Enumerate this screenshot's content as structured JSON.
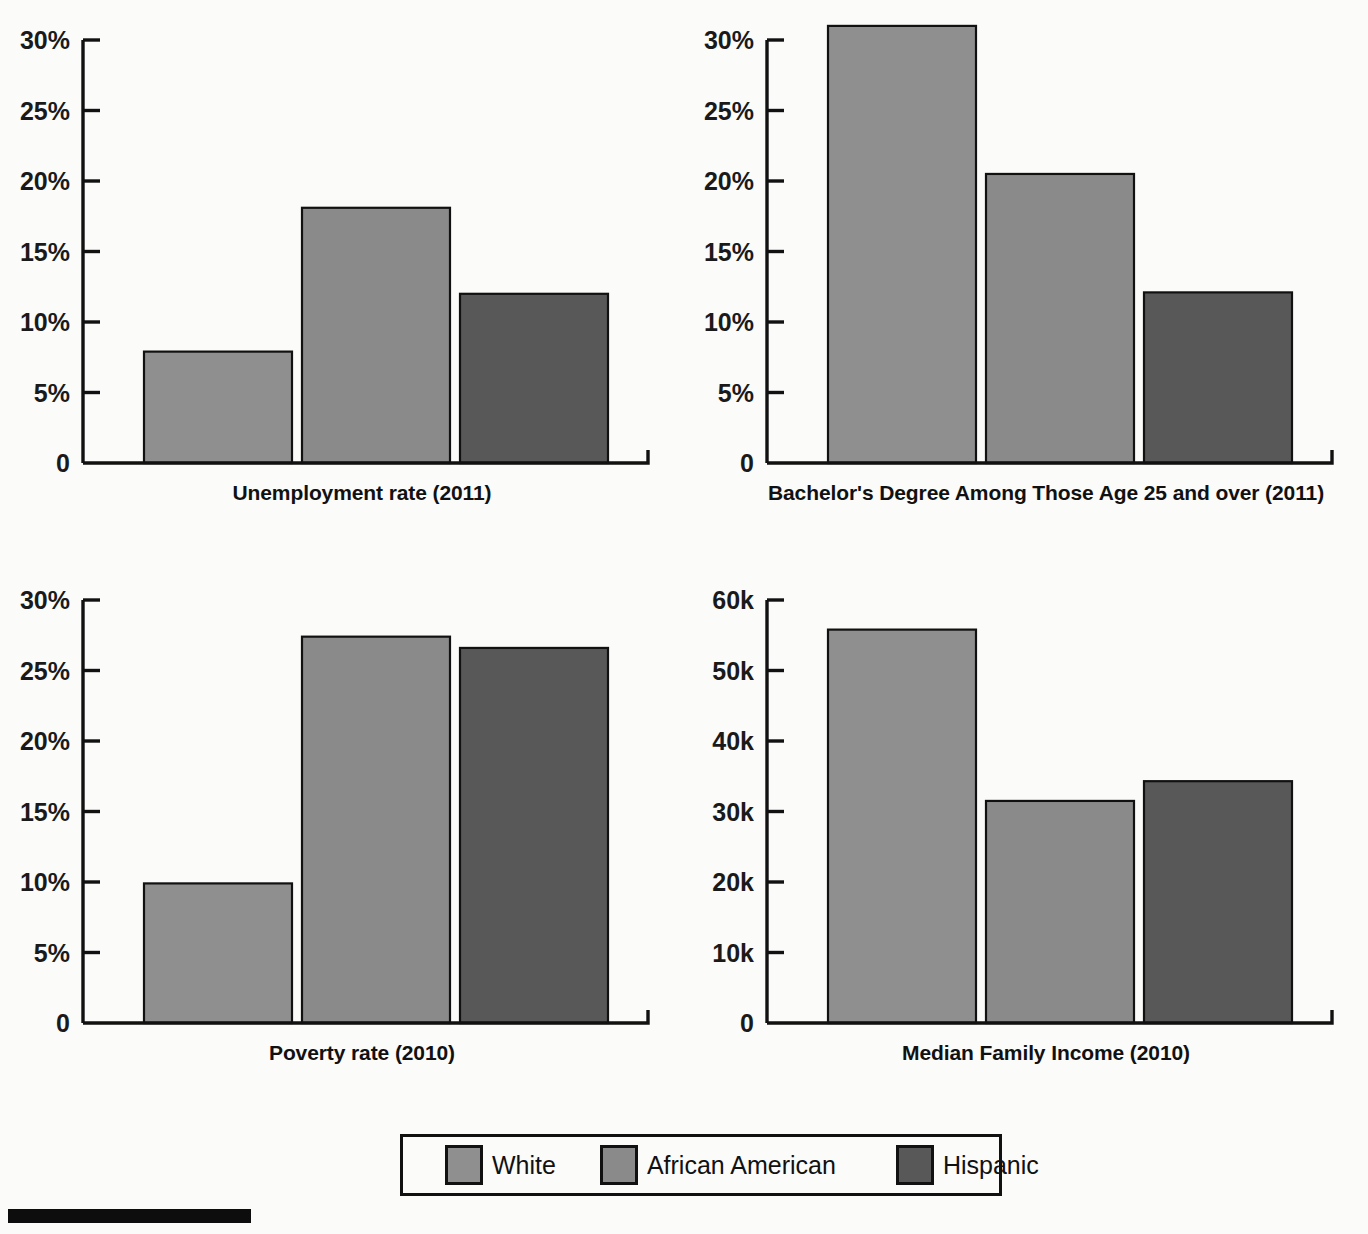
{
  "page": {
    "background_color": "#fbfbfa",
    "ink_color": "#111111"
  },
  "series_colors": {
    "White": "#8f8f8f",
    "African American": "#8a8a8a",
    "Hispanic": "#585858"
  },
  "legend": {
    "position": "bottom-center",
    "border_color": "#111111",
    "items": [
      {
        "label": "White",
        "color": "#8f8f8f"
      },
      {
        "label": "African American",
        "color": "#8a8a8a"
      },
      {
        "label": "Hispanic",
        "color": "#585858"
      }
    ]
  },
  "footer_rule": {
    "color": "#0d0d0d"
  },
  "chart_data": [
    {
      "id": "unemployment",
      "type": "bar",
      "title": "Unemployment rate (2011)",
      "title_position": "below-axis",
      "xlabel": "",
      "ylabel": "",
      "categories": [
        "White",
        "African American",
        "Hispanic"
      ],
      "values": [
        7.9,
        18.1,
        12.0
      ],
      "value_suffix": "%",
      "ylim": [
        0,
        30
      ],
      "yticks": [
        0,
        5,
        10,
        15,
        20,
        25,
        30
      ],
      "ytick_labels": [
        "0",
        "5%",
        "10%",
        "15%",
        "20%",
        "25%",
        "30%"
      ],
      "grid": false,
      "legend_shown": false
    },
    {
      "id": "bachelors",
      "type": "bar",
      "title": "Bachelor's Degree Among Those Age 25 and over (2011)",
      "title_position": "below-axis",
      "xlabel": "",
      "ylabel": "",
      "categories": [
        "White",
        "African American",
        "Hispanic"
      ],
      "values": [
        31.0,
        20.5,
        12.1
      ],
      "value_suffix": "%",
      "ylim": [
        0,
        30
      ],
      "yticks": [
        0,
        5,
        10,
        15,
        20,
        25,
        30
      ],
      "ytick_labels": [
        "0",
        "5%",
        "10%",
        "15%",
        "20%",
        "25%",
        "30%"
      ],
      "grid": false,
      "legend_shown": false
    },
    {
      "id": "poverty",
      "type": "bar",
      "title": "Poverty rate (2010)",
      "title_position": "below-axis",
      "xlabel": "",
      "ylabel": "",
      "categories": [
        "White",
        "African American",
        "Hispanic"
      ],
      "values": [
        9.9,
        27.4,
        26.6
      ],
      "value_suffix": "%",
      "ylim": [
        0,
        30
      ],
      "yticks": [
        0,
        5,
        10,
        15,
        20,
        25,
        30
      ],
      "ytick_labels": [
        "0",
        "5%",
        "10%",
        "15%",
        "20%",
        "25%",
        "30%"
      ],
      "grid": false,
      "legend_shown": false
    },
    {
      "id": "income",
      "type": "bar",
      "title": "Median Family Income  (2010)",
      "title_position": "below-axis",
      "xlabel": "",
      "ylabel": "",
      "categories": [
        "White",
        "African American",
        "Hispanic"
      ],
      "values": [
        55800,
        31500,
        34300
      ],
      "value_suffix": "",
      "ylim": [
        0,
        60000
      ],
      "yticks": [
        0,
        10000,
        20000,
        30000,
        40000,
        50000,
        60000
      ],
      "ytick_labels": [
        "0",
        "10k",
        "20k",
        "30k",
        "40k",
        "50k",
        "60k"
      ],
      "grid": false,
      "legend_shown": false
    }
  ]
}
